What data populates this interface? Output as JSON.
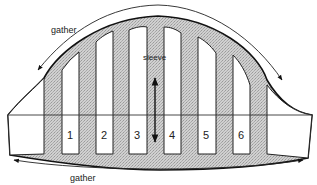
{
  "diagram": {
    "type": "sleeve pattern slash-and-spread",
    "labels": {
      "gather_top": "gather",
      "gather_bottom": "gather",
      "sleeve": "sleeve"
    },
    "strips": [
      {
        "number": "1"
      },
      {
        "number": "2"
      },
      {
        "number": "3"
      },
      {
        "number": "4"
      },
      {
        "number": "5"
      },
      {
        "number": "6"
      }
    ],
    "colors": {
      "fill_spread": "#c8c8c8",
      "strip_fill": "#ffffff",
      "outline": "#111111",
      "line": "#333333"
    }
  }
}
